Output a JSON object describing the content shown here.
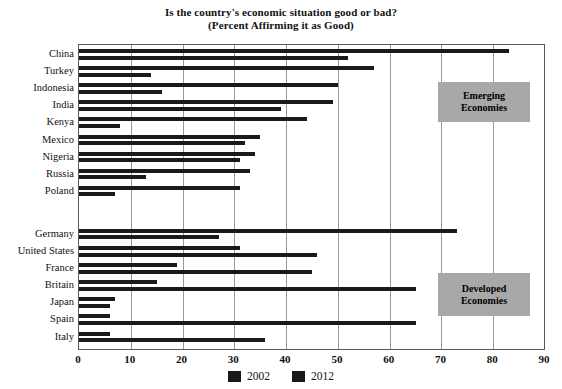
{
  "chart_data": {
    "type": "bar",
    "orientation": "horizontal",
    "title": "Is the country's economic situation good or bad?",
    "subtitle": "(Percent Affirming it as Good)",
    "xlabel": "",
    "ylabel": "",
    "xlim": [
      0,
      90
    ],
    "xticks": [
      0,
      10,
      20,
      30,
      40,
      50,
      60,
      70,
      80,
      90
    ],
    "grid": true,
    "legend_position": "bottom",
    "series": [
      {
        "name": "2002",
        "color": "#1a1a1a",
        "values": [
          83,
          57,
          50,
          49,
          44,
          35,
          34,
          33,
          31,
          73,
          31,
          19,
          15,
          7,
          6,
          6
        ]
      },
      {
        "name": "2012",
        "color": "#1a1a1a",
        "values": [
          52,
          14,
          16,
          39,
          8,
          32,
          31,
          13,
          7,
          27,
          46,
          45,
          65,
          6,
          65,
          36
        ]
      }
    ],
    "categories": [
      "China",
      "Turkey",
      "Indonesia",
      "India",
      "Kenya",
      "Mexico",
      "Nigeria",
      "Russia",
      "Poland",
      "Germany",
      "United States",
      "France",
      "Britain",
      "Japan",
      "Spain",
      "Italy"
    ],
    "groups": [
      {
        "label_line1": "Emerging",
        "label_line2": "Economies",
        "categories": [
          "China",
          "Turkey",
          "Indonesia",
          "India",
          "Kenya",
          "Mexico",
          "Nigeria",
          "Russia",
          "Poland"
        ]
      },
      {
        "label_line1": "Developed",
        "label_line2": "Economies",
        "categories": [
          "Germany",
          "United States",
          "France",
          "Britain",
          "Japan",
          "Spain",
          "Italy"
        ]
      }
    ],
    "annotations": [
      {
        "text": "Emerging Economies"
      },
      {
        "text": "Developed Economies"
      }
    ],
    "legend": [
      {
        "label": "2002",
        "color": "#1a1a1a"
      },
      {
        "label": "2012",
        "color": "#1a1a1a"
      }
    ]
  }
}
